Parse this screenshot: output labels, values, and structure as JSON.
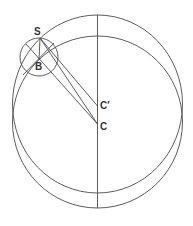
{
  "diagram": {
    "type": "geometry",
    "stroke_color": "#4a4a4a",
    "labels": {
      "S": "S",
      "B": "B",
      "C_prime": "C′",
      "C": "C"
    },
    "shapes": {
      "large_circle_upper": {
        "cx": 97.5,
        "cy": 104,
        "rx": 85,
        "ry": 89
      },
      "large_circle_lower": {
        "cx": 97.5,
        "cy": 122,
        "rx": 85,
        "ry": 86
      },
      "small_circle_B": {
        "cx": 39,
        "cy": 57,
        "r": 19
      },
      "vertical_axis": {
        "x": 97.5,
        "y1": 15,
        "y2": 208
      }
    },
    "points": {
      "S": [
        40,
        38
      ],
      "B": [
        39,
        60
      ],
      "C_prime": [
        97.5,
        106
      ],
      "C": [
        97.5,
        124
      ]
    }
  }
}
